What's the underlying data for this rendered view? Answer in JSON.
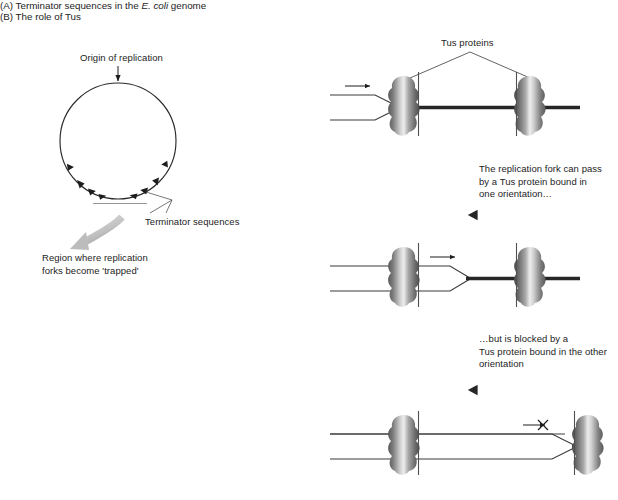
{
  "figure": {
    "width": 618,
    "height": 500,
    "background": "#ffffff"
  },
  "panel_a": {
    "title_prefix": "(A) Terminator sequences in the ",
    "title_italic": "E. coli",
    "title_suffix": " genome",
    "origin_label": "Origin of replication",
    "terminator_label": "Terminator sequences",
    "trapped_label": "Region where replication\nforks become 'trapped'"
  },
  "panel_b": {
    "title": "(B) The role of Tus",
    "tus_label": "Tus proteins",
    "step_text_1": "The replication fork can pass\nby a Tus protein bound in\none orientation…",
    "step_text_2": "…but is blocked by a\nTus protein bound in the other\norientation",
    "block_marker": "×"
  },
  "colors": {
    "ink": "#1d1d1d",
    "dna_thick": "#262626",
    "dna_thin": "#3a3a3a",
    "protein_dark": "#4a4a4a",
    "protein_mid": "#8d8d8d",
    "protein_light": "#e9e9e9",
    "gray_arrow": "#b8b8b8",
    "leader": "#555555"
  }
}
